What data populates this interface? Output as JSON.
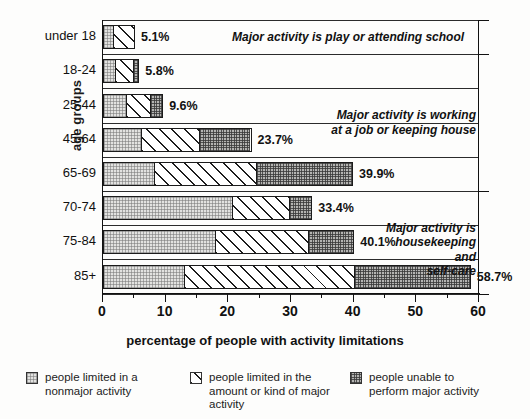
{
  "chart_data": {
    "type": "bar",
    "orientation": "horizontal",
    "stacked": true,
    "title": "",
    "xlabel": "percentage of people with activity limitations",
    "ylabel": "age groups",
    "xlim": [
      0,
      60
    ],
    "xticks": [
      0,
      10,
      20,
      30,
      40,
      50,
      60
    ],
    "xtick_labels": [
      "0",
      "10",
      "20",
      "30",
      "40",
      "50",
      "60"
    ],
    "minor_tick_step": 5,
    "grid": false,
    "legend_position": "bottom",
    "categories": [
      "under 18",
      "18-24",
      "25-44",
      "45-64",
      "65-69",
      "70-74",
      "75-84",
      "85+"
    ],
    "series": [
      {
        "name": "people limited in a nonmajor activity",
        "pattern": "light-stipple",
        "values": [
          1.5,
          1.9,
          3.7,
          6.0,
          8.1,
          20.7,
          17.8,
          12.9
        ]
      },
      {
        "name": "people limited in the amount or kind of major activity",
        "pattern": "diagonal-hatch",
        "values": [
          3.6,
          3.0,
          3.9,
          9.3,
          16.4,
          9.1,
          15.0,
          27.2
        ]
      },
      {
        "name": "people unable to perform major activity",
        "pattern": "dark-stipple",
        "values": [
          0.0,
          0.9,
          2.0,
          8.4,
          15.4,
          3.6,
          7.3,
          18.6
        ]
      }
    ],
    "totals": [
      5.1,
      5.8,
      9.6,
      23.7,
      39.9,
      33.4,
      40.1,
      58.7
    ],
    "total_labels": [
      "5.1%",
      "5.8%",
      "9.6%",
      "23.7%",
      "39.9%",
      "33.4%",
      "40.1%",
      "58.7%"
    ],
    "annotations": [
      {
        "text": "Major activity is play or attending school",
        "groups": [
          "under 18"
        ]
      },
      {
        "text": "Major activity is working\nat a job or keeping house",
        "groups": [
          "18-24",
          "25-44",
          "45-64",
          "65-69"
        ]
      },
      {
        "text": "Major activity is\nhousekeeping and\nself-care",
        "groups": [
          "70-74",
          "75-84",
          "85+"
        ]
      }
    ],
    "legend": [
      {
        "label": "people limited in a\nnonmajor activity",
        "pattern": "light-stipple"
      },
      {
        "label": "people limited in the\namount or kind of major\nactivity",
        "pattern": "diagonal-hatch"
      },
      {
        "label": "people unable to\nperform major activity",
        "pattern": "dark-stipple"
      }
    ],
    "colors": {
      "light": "#e2e2e0",
      "hatch": "#ffffff",
      "dark": "#b4b4b2",
      "outline": "#1b1b1b",
      "text": "#111111",
      "background": "#fdfdfc"
    }
  }
}
